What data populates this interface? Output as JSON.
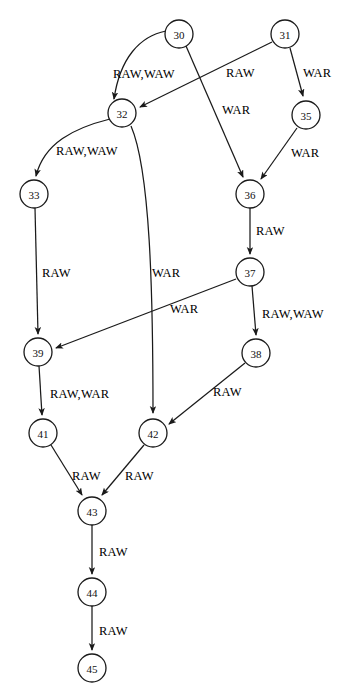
{
  "figure": {
    "kind": "directed-dependence-graph",
    "background_color": "#ffffff",
    "stroke_color": "#1a1a1a",
    "text_color": "#111111",
    "node_radius": 14
  },
  "nodes": [
    {
      "id": "30",
      "label": "30",
      "x": 179,
      "y": 34
    },
    {
      "id": "31",
      "label": "31",
      "x": 285,
      "y": 34
    },
    {
      "id": "32",
      "label": "32",
      "x": 122,
      "y": 113
    },
    {
      "id": "35",
      "label": "35",
      "x": 306,
      "y": 115
    },
    {
      "id": "33",
      "label": "33",
      "x": 34,
      "y": 194
    },
    {
      "id": "36",
      "label": "36",
      "x": 250,
      "y": 194
    },
    {
      "id": "37",
      "label": "37",
      "x": 250,
      "y": 272
    },
    {
      "id": "38",
      "label": "38",
      "x": 256,
      "y": 353
    },
    {
      "id": "39",
      "label": "39",
      "x": 38,
      "y": 352
    },
    {
      "id": "41",
      "label": "41",
      "x": 43,
      "y": 433
    },
    {
      "id": "42",
      "label": "42",
      "x": 153,
      "y": 433
    },
    {
      "id": "43",
      "label": "43",
      "x": 92,
      "y": 511
    },
    {
      "id": "44",
      "label": "44",
      "x": 92,
      "y": 592
    },
    {
      "id": "45",
      "label": "45",
      "x": 92,
      "y": 668
    }
  ],
  "edges": [
    {
      "id": "e30-32",
      "from": "30",
      "to": "32",
      "label": "RAW,WAW",
      "path": "M 166 31 C 140 36, 120 58, 114 99",
      "label_x": 113,
      "label_y": 68
    },
    {
      "id": "e30-36",
      "from": "30",
      "to": "36",
      "label": "WAR",
      "path": "M 186 46 L 243 177",
      "label_x": 222,
      "label_y": 104
    },
    {
      "id": "e31-32",
      "from": "31",
      "to": "32",
      "label": "RAW",
      "path": "M 272 42 L 140 107",
      "label_x": 226,
      "label_y": 67
    },
    {
      "id": "e31-35",
      "from": "31",
      "to": "35",
      "label": "WAR",
      "path": "M 290 48 L 303 96",
      "label_x": 303,
      "label_y": 67
    },
    {
      "id": "e35-36",
      "from": "35",
      "to": "36",
      "label": "WAR",
      "path": "M 297 128 L 261 179",
      "label_x": 291,
      "label_y": 147
    },
    {
      "id": "e32-33",
      "from": "32",
      "to": "33",
      "label": "RAW,WAW",
      "path": "M 110 119 C 74 128, 44 143, 36 176",
      "label_x": 56,
      "label_y": 145
    },
    {
      "id": "e32-42",
      "from": "32",
      "to": "42",
      "label": "WAR",
      "path": "M 131 126 C 150 170, 153 290, 153 413",
      "label_x": 152,
      "label_y": 267
    },
    {
      "id": "e33-39",
      "from": "33",
      "to": "39",
      "label": "RAW",
      "path": "M 35 208 L 38 334",
      "label_x": 42,
      "label_y": 267
    },
    {
      "id": "e36-37",
      "from": "36",
      "to": "37",
      "label": "RAW",
      "path": "M 250 208 L 250 254",
      "label_x": 256,
      "label_y": 225
    },
    {
      "id": "e37-39",
      "from": "37",
      "to": "39",
      "label": "WAR",
      "path": "M 236 279 L 56 348",
      "label_x": 170,
      "label_y": 303
    },
    {
      "id": "e37-38",
      "from": "37",
      "to": "38",
      "label": "RAW,WAW",
      "path": "M 252 286 L 256 335",
      "label_x": 262,
      "label_y": 308
    },
    {
      "id": "e38-42",
      "from": "38",
      "to": "42",
      "label": "RAW",
      "path": "M 245 363 L 169 424",
      "label_x": 213,
      "label_y": 386
    },
    {
      "id": "e39-41",
      "from": "39",
      "to": "41",
      "label": "RAW,WAR",
      "path": "M 39 366 L 42 415",
      "label_x": 50,
      "label_y": 388
    },
    {
      "id": "e41-43",
      "from": "41",
      "to": "43",
      "label": "RAW",
      "path": "M 51 445 L 82 495",
      "label_x": 72,
      "label_y": 470
    },
    {
      "id": "e42-43",
      "from": "42",
      "to": "43",
      "label": "RAW",
      "path": "M 144 445 L 102 495",
      "label_x": 125,
      "label_y": 470
    },
    {
      "id": "e43-44",
      "from": "43",
      "to": "44",
      "label": "RAW",
      "path": "M 92 525 L 92 574",
      "label_x": 99,
      "label_y": 546
    },
    {
      "id": "e44-45",
      "from": "44",
      "to": "45",
      "label": "RAW",
      "path": "M 92 606 L 92 650",
      "label_x": 99,
      "label_y": 625
    }
  ]
}
